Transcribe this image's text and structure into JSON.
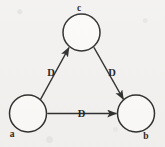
{
  "diagram": {
    "background_color": "#f2f1ef",
    "stroke_color": "#1d1d1d",
    "node_fill": "#fbfaf8",
    "nodes": [
      {
        "id": "c",
        "label": "c",
        "cx": 81.5,
        "cy": 32.5,
        "r": 18.5,
        "label_x": 79,
        "label_y": 11
      },
      {
        "id": "a",
        "label": "a",
        "cx": 28.0,
        "cy": 113.5,
        "r": 18.5,
        "label_x": 12,
        "label_y": 137
      },
      {
        "id": "b",
        "label": "b",
        "cx": 136.0,
        "cy": 113.5,
        "r": 18.5,
        "label_x": 146,
        "label_y": 139
      }
    ],
    "edges": [
      {
        "id": "a-c",
        "from": "a",
        "to": "c",
        "label": "D",
        "bidirectional": true,
        "label_x": 51,
        "label_y": 76
      },
      {
        "id": "c-b",
        "from": "c",
        "to": "b",
        "label": "D",
        "bidirectional": true,
        "label_x": 112,
        "label_y": 76
      },
      {
        "id": "a-b",
        "from": "a",
        "to": "b",
        "label": "D",
        "bidirectional": true,
        "label_x": 81.5,
        "label_y": 117
      }
    ]
  }
}
